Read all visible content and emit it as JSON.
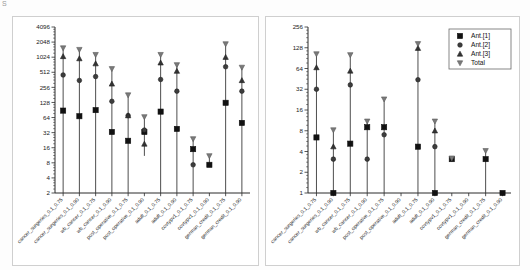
{
  "figure": {
    "corner_mark": "S",
    "background": "#ffffff",
    "panel_border": "#cfcfcf"
  },
  "legend": {
    "position": "top-right-of-right-panel",
    "entries": [
      {
        "label": "Ant.[1]",
        "marker": "square"
      },
      {
        "label": "Ant.[2]",
        "marker": "circle"
      },
      {
        "label": "Ant.[3]",
        "marker": "triangle-up"
      },
      {
        "label": "Total",
        "marker": "triangle-down"
      }
    ]
  },
  "categories": [
    "cancer_surgeries_0.1_0.75",
    "cancer_surgeries_0.1_0.90",
    "wb_cancer_0.1_0.75",
    "wb_cancer_0.1_0.90",
    "post_operative_0.1_0.75",
    "post_operative_0.1_0.90",
    "adult_0.1_0.75",
    "adult_0.1_0.90",
    "covtypv1_0.1_0.75",
    "covtypv1_0.1_0.90",
    "german_credit_0.1_0.75",
    "german_credit_0.1_0.90"
  ],
  "chart_data": [
    {
      "id": "left",
      "type": "scatter",
      "title": "",
      "xlabel": "",
      "ylabel": "",
      "yscale": "log2",
      "ylim": [
        2,
        4096
      ],
      "yticks": [
        2,
        4,
        8,
        16,
        32,
        64,
        128,
        256,
        512,
        1024,
        2048,
        4096
      ],
      "ytick_labels": [
        "2",
        "4",
        "8",
        "16",
        "32",
        "64",
        "128",
        "256",
        "512",
        "1024",
        "2048",
        "4096"
      ],
      "grid": false,
      "categories": [
        "cancer_surgeries_0.1_0.75",
        "cancer_surgeries_0.1_0.90",
        "wb_cancer_0.1_0.75",
        "wb_cancer_0.1_0.90",
        "post_operative_0.1_0.75",
        "post_operative_0.1_0.90",
        "adult_0.1_0.75",
        "adult_0.1_0.90",
        "covtypv1_0.1_0.75",
        "covtypv1_0.1_0.90",
        "german_credit_0.1_0.75",
        "german_credit_0.1_0.90"
      ],
      "series": [
        {
          "name": "Ant.[1]",
          "marker": "square",
          "values": [
            88,
            68,
            90,
            33,
            22,
            33,
            84,
            38,
            15,
            7.3,
            126,
            50
          ]
        },
        {
          "name": "Ant.[2]",
          "marker": "circle",
          "values": [
            452,
            352,
            420,
            135,
            70,
            36,
            368,
            215,
            7.3,
            null,
            660,
            215
          ]
        },
        {
          "name": "Ant.[3]",
          "marker": "triangle-up",
          "values": [
            1060,
            960,
            760,
            300,
            70,
            19,
            790,
            540,
            null,
            null,
            1024,
            352
          ]
        },
        {
          "name": "Total",
          "marker": "triangle-down",
          "values": [
            1560,
            1450,
            1150,
            600,
            180,
            66,
            1150,
            720,
            24,
            11,
            1880,
            640
          ]
        }
      ],
      "errorbar_low": [
        2,
        2,
        2,
        2,
        2,
        11,
        2,
        2,
        2,
        7.3,
        2,
        2
      ],
      "errorbar_high": [
        1560,
        1450,
        1150,
        600,
        180,
        66,
        1150,
        720,
        24,
        11,
        1880,
        640
      ]
    },
    {
      "id": "right",
      "type": "scatter",
      "title": "",
      "xlabel": "",
      "ylabel": "",
      "yscale": "log2",
      "ylim": [
        1,
        256
      ],
      "yticks": [
        1,
        2,
        4,
        8,
        16,
        32,
        64,
        128,
        256
      ],
      "ytick_labels": [
        "1",
        "2",
        "4",
        "8",
        "16",
        "32",
        "64",
        "128",
        "256"
      ],
      "grid": false,
      "categories": [
        "cancer_surgeries_0.1_0.75",
        "cancer_surgeries_0.1_0.90",
        "wb_cancer_0.1_0.75",
        "wb_cancer_0.1_0.90",
        "post_operative_0.1_0.75",
        "post_operative_0.1_0.90",
        "adult_0.1_0.75",
        "adult_0.1_0.90",
        "covtypv1_0.1_0.75",
        "covtypv1_0.1_0.90",
        "german_credit_0.1_0.75",
        "german_credit_0.1_0.90"
      ],
      "series": [
        {
          "name": "Ant.[1]",
          "marker": "square",
          "values": [
            6.4,
            1,
            5.2,
            9,
            9,
            null,
            4.7,
            1,
            3.1,
            null,
            3.1,
            1
          ]
        },
        {
          "name": "Ant.[2]",
          "marker": "circle",
          "values": [
            32,
            3.1,
            37,
            3.1,
            7,
            null,
            44,
            4.7,
            null,
            null,
            null,
            null
          ]
        },
        {
          "name": "Ant.[3]",
          "marker": "triangle-up",
          "values": [
            66,
            4.7,
            59,
            null,
            null,
            null,
            126,
            8,
            null,
            null,
            null,
            null
          ]
        },
        {
          "name": "Total",
          "marker": "triangle-down",
          "values": [
            104,
            8.2,
            101,
            11,
            23,
            null,
            146,
            11,
            3.2,
            null,
            4.1,
            null
          ]
        }
      ],
      "errorbar_low": [
        1,
        1,
        1,
        1,
        1,
        null,
        1,
        1,
        3.1,
        null,
        1,
        1
      ],
      "errorbar_high": [
        104,
        8.2,
        101,
        11,
        23,
        null,
        146,
        11,
        3.2,
        null,
        4.1,
        1
      ]
    }
  ]
}
